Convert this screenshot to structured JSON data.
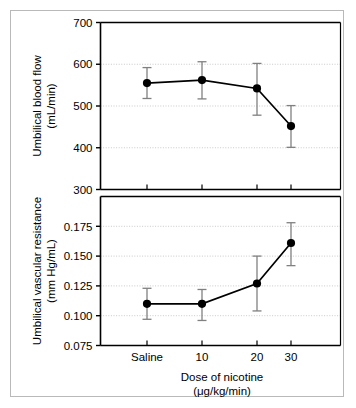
{
  "figure": {
    "panel_count": 2,
    "background_color": "#ffffff",
    "border_color": "#b9b9b9",
    "marker_color": "#000000",
    "line_color": "#000000",
    "errorbar_color": "#808080",
    "gridline_color": "#bdbdbd"
  },
  "chart_data": [
    {
      "type": "line",
      "panel": "top",
      "title": "",
      "xlabel": "",
      "ylabel": "Umbilical blood flow (mL/min)",
      "ylabel_lines": [
        "Umbilical blood flow",
        "(mL/min)"
      ],
      "categories": [
        "Saline",
        "10",
        "20",
        "30"
      ],
      "x": [
        0,
        1,
        2,
        3
      ],
      "values": [
        555,
        562,
        542,
        452
      ],
      "error_low": [
        518,
        517,
        478,
        401
      ],
      "error_high": [
        592,
        606,
        602,
        501
      ],
      "ylim": [
        300,
        700
      ],
      "yticks": [
        300,
        400,
        500,
        600,
        700
      ],
      "ytick_labels": [
        "300",
        "400",
        "500",
        "600",
        "700"
      ],
      "grid": true,
      "grid_axis": "y",
      "legend": "none",
      "markers": "filled-circle",
      "errorbars": "caps"
    },
    {
      "type": "line",
      "panel": "bottom",
      "title": "",
      "xlabel": "Dose of nicotine (μg/kg/min)",
      "xlabel_lines": [
        "Dose of nicotine",
        "(μg/kg/min)"
      ],
      "ylabel": "Umbilical vascular resistance (mm Hg/mL)",
      "ylabel_lines": [
        "Umbilical vascular resistance",
        "(mm Hg/mL)"
      ],
      "categories": [
        "Saline",
        "10",
        "20",
        "30"
      ],
      "x": [
        0,
        1,
        2,
        3
      ],
      "values": [
        0.11,
        0.11,
        0.127,
        0.161
      ],
      "error_low": [
        0.097,
        0.096,
        0.104,
        0.142
      ],
      "error_high": [
        0.123,
        0.122,
        0.15,
        0.178
      ],
      "ylim": [
        0.075,
        0.2
      ],
      "yticks": [
        0.075,
        0.1,
        0.125,
        0.15,
        0.175
      ],
      "ytick_labels": [
        "0.075",
        "0.100",
        "0.125",
        "0.150",
        "0.175"
      ],
      "grid": true,
      "grid_axis": "y",
      "legend": "none",
      "markers": "filled-circle",
      "errorbars": "caps"
    }
  ]
}
